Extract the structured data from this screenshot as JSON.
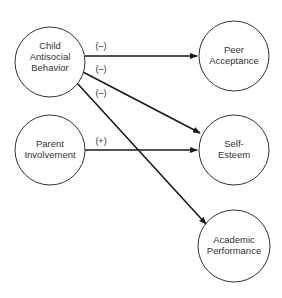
{
  "diagram": {
    "type": "path-model",
    "nodes": [
      {
        "id": "child",
        "lines": [
          "Child",
          "Antisocial",
          "Behavior"
        ],
        "cx": 50,
        "cy": 62,
        "r": 35
      },
      {
        "id": "parent",
        "lines": [
          "Parent",
          "Involvement"
        ],
        "cx": 50,
        "cy": 150,
        "r": 35
      },
      {
        "id": "peer",
        "lines": [
          "Peer",
          "Acceptance"
        ],
        "cx": 234,
        "cy": 74,
        "r": 35
      },
      {
        "id": "self",
        "lines": [
          "Self-",
          "Esteem"
        ],
        "cx": 234,
        "cy": 150,
        "r": 35
      },
      {
        "id": "academic",
        "lines": [
          "Academic",
          "Performance"
        ],
        "cx": 234,
        "cy": 246,
        "r": 36
      }
    ],
    "edges": [
      {
        "from": "child",
        "to": "peer",
        "sign": "(–)"
      },
      {
        "from": "child",
        "to": "self",
        "sign": "(–)"
      },
      {
        "from": "child",
        "to": "academic",
        "sign": "(–)"
      },
      {
        "from": "parent",
        "to": "self",
        "sign": "(+)"
      }
    ]
  }
}
